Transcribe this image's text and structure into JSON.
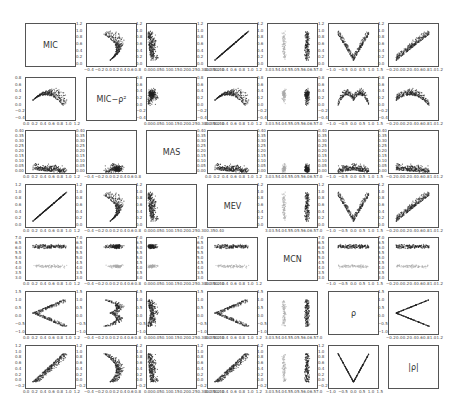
{
  "chart_data": {
    "type": "scatter",
    "title": "",
    "layout": "scatter-matrix 7x7",
    "variables": [
      "MIC",
      "MIC−ρ²",
      "MAS",
      "MEV",
      "MCN",
      "ρ",
      "|ρ|"
    ],
    "diagonal_labels": [
      "MIC",
      "MIC−ρ²",
      "MAS",
      "MEV",
      "MCN",
      "ρ",
      "|ρ|"
    ],
    "axis_ranges": {
      "MIC": [
        0.0,
        1.2
      ],
      "MIC−ρ²": [
        -0.4,
        0.8
      ],
      "MAS": [
        0.0,
        0.4
      ],
      "MEV": [
        0.0,
        1.2
      ],
      "MCN": [
        3.0,
        7.0
      ],
      "ρ": [
        -1.5,
        1.5
      ],
      "|ρ|": [
        -0.2,
        1.2
      ]
    },
    "x_tick_labels": {
      "MIC": [
        "0.0",
        "0.2",
        "0.4",
        "0.6",
        "0.8",
        "1.0",
        "1.2"
      ],
      "MIC−ρ²": [
        "−0.4",
        "−0.2",
        "0.0",
        "0.2",
        "0.4",
        "0.6",
        "0.8"
      ],
      "MAS": [
        "0.00",
        "0.05",
        "0.10",
        "0.15",
        "0.20",
        "0.25",
        "0.30",
        "0.35",
        "0.40"
      ],
      "MEV": [
        "0.0",
        "0.2",
        "0.4",
        "0.6",
        "0.8",
        "1.0",
        "1.2"
      ],
      "MCN": [
        "3.0",
        "3.5",
        "4.0",
        "4.5",
        "5.0",
        "5.5",
        "6.0",
        "6.5",
        "7.0"
      ],
      "ρ": [
        "−1.0",
        "−0.5",
        "0.0",
        "0.5",
        "1.0",
        "1.5"
      ],
      "|ρ|": [
        "−0.2",
        "0.0",
        "0.2",
        "0.4",
        "0.6",
        "0.8",
        "1.0",
        "1.2"
      ]
    },
    "y_tick_labels": {
      "MIC": [
        "0.0",
        "0.2",
        "0.4",
        "0.6",
        "0.8",
        "1.0",
        "1.2"
      ],
      "MIC−ρ²": [
        "−0.4",
        "−0.2",
        "0.0",
        "0.2",
        "0.4",
        "0.6",
        "0.8"
      ],
      "MAS": [
        "0.00",
        "0.05",
        "0.10",
        "0.15",
        "0.20",
        "0.25",
        "0.30",
        "0.35",
        "0.40"
      ],
      "MEV": [
        "0.0",
        "0.2",
        "0.4",
        "0.6",
        "0.8",
        "1.0",
        "1.2"
      ],
      "MCN": [
        "3.0",
        "3.5",
        "4.0",
        "4.5",
        "5.0",
        "5.5",
        "6.0",
        "6.5",
        "7.0"
      ],
      "ρ": [
        "−1.0",
        "−0.5",
        "0.0",
        "0.5",
        "1.0",
        "1.5"
      ],
      "|ρ|": [
        "−0.2",
        "0.0",
        "0.2",
        "0.4",
        "0.6",
        "0.8",
        "1.0",
        "1.2"
      ]
    },
    "panel_shapes": {
      "MIC_vs_MEV": "identity line",
      "rho_vs_absrho": "V shape",
      "absrho_vs_rho": "sideways V (<) shape",
      "MIC_vs_rho": "U-shaped cloud",
      "MICminusRho2_vs_rho": "inverted-U cloud",
      "MCN_columns": "two clusters: dark near 6.0-6.5, light gray near 4.0-4.5"
    },
    "grid": false,
    "legend": "none"
  },
  "figure": {
    "cols": 7,
    "rows": 7,
    "point_color_dark": "#222222",
    "point_color_light": "#aaaaaa",
    "frame_color": "#555555"
  }
}
